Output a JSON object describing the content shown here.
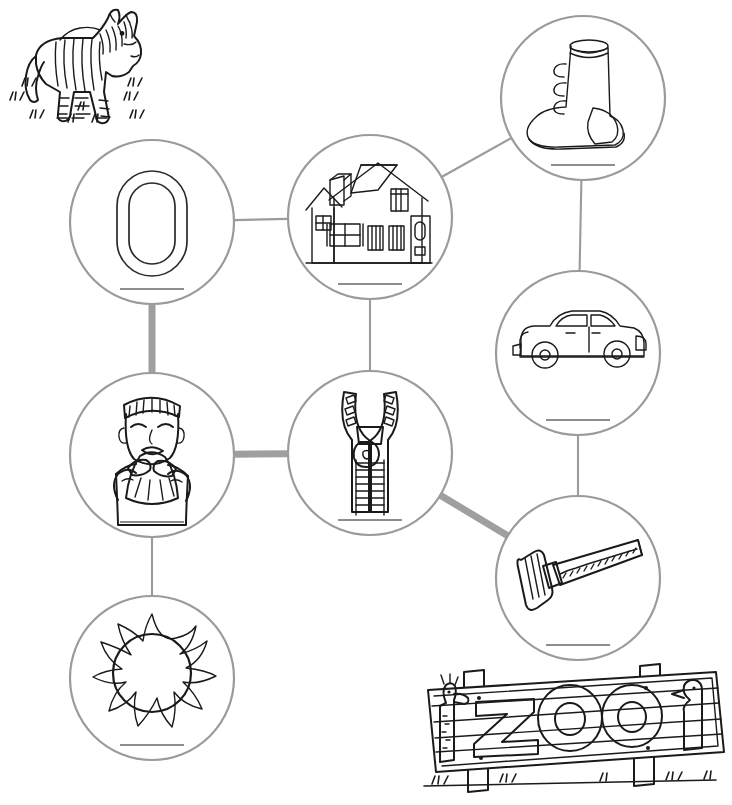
{
  "worksheet": {
    "title": "Z Sound Picture Maze",
    "background_color": "#ffffff",
    "line_color": "#9b9b9b",
    "highlight_color": "#9f9f9f",
    "ink_color": "#1a1a1a"
  },
  "decorations": [
    {
      "id": "zebra",
      "name": "zebra-illustration",
      "label": "zebra",
      "x": 20,
      "y": 8,
      "width": 130,
      "height": 120
    },
    {
      "id": "zoo-sign",
      "name": "zoo-sign-illustration",
      "label": "zoo",
      "sign_text": "ZOO",
      "x": 424,
      "y": 664,
      "width": 300,
      "height": 130
    }
  ],
  "nodes": [
    {
      "id": "o-letter",
      "name": "node-letter-o",
      "label": "O",
      "cx": 152,
      "cy": 222,
      "r": 82,
      "answer_line": true
    },
    {
      "id": "house",
      "name": "node-house",
      "label": "house",
      "cx": 370,
      "cy": 217,
      "r": 82,
      "answer_line": true
    },
    {
      "id": "boot",
      "name": "node-boot",
      "label": "boot",
      "cx": 583,
      "cy": 98,
      "r": 82,
      "answer_line": true
    },
    {
      "id": "boy-sneeze",
      "name": "node-boy-sneeze",
      "label": "sneeze",
      "cx": 152,
      "cy": 455,
      "r": 82,
      "answer_line": true
    },
    {
      "id": "zipper",
      "name": "node-zipper",
      "label": "zipper",
      "cx": 370,
      "cy": 453,
      "r": 82,
      "answer_line": true
    },
    {
      "id": "car",
      "name": "node-car",
      "label": "car",
      "cx": 578,
      "cy": 353,
      "r": 82,
      "answer_line": true
    },
    {
      "id": "hammer",
      "name": "node-hammer",
      "label": "hammer",
      "cx": 578,
      "cy": 578,
      "r": 82,
      "answer_line": true
    },
    {
      "id": "sun",
      "name": "node-sun",
      "label": "sun",
      "cx": 152,
      "cy": 678,
      "r": 82,
      "answer_line": true
    }
  ],
  "connections": [
    {
      "id": "o-house",
      "name": "connector-o-house",
      "from": "o-letter",
      "to": "house",
      "style": "thin"
    },
    {
      "id": "house-boot",
      "name": "connector-house-boot",
      "from": "house",
      "to": "boot",
      "style": "thin"
    },
    {
      "id": "boot-car",
      "name": "connector-boot-car",
      "from": "boot",
      "to": "car",
      "style": "thin"
    },
    {
      "id": "car-hammer",
      "name": "connector-car-hammer",
      "from": "car",
      "to": "hammer",
      "style": "thin"
    },
    {
      "id": "house-zipper",
      "name": "connector-house-zipper",
      "from": "house",
      "to": "zipper",
      "style": "thin"
    },
    {
      "id": "boy-sun",
      "name": "connector-boy-sun",
      "from": "boy-sneeze",
      "to": "sun",
      "style": "thin"
    },
    {
      "id": "o-boy",
      "name": "connector-o-boy",
      "from": "o-letter",
      "to": "boy-sneeze",
      "style": "thick"
    },
    {
      "id": "boy-zipper",
      "name": "connector-boy-zipper",
      "from": "boy-sneeze",
      "to": "zipper",
      "style": "thick"
    },
    {
      "id": "zipper-hammer",
      "name": "connector-zipper-hammer",
      "from": "zipper",
      "to": "hammer",
      "style": "thick"
    }
  ]
}
